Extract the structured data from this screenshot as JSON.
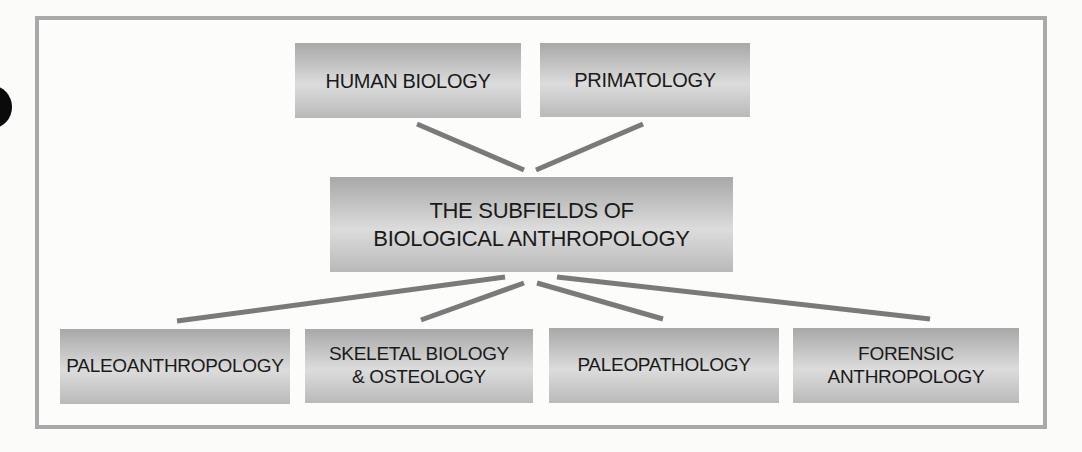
{
  "diagram": {
    "type": "hierarchy",
    "central": {
      "lines": [
        "THE SUBFIELDS OF",
        "BIOLOGICAL ANTHROPOLOGY"
      ]
    },
    "upper_nodes": [
      {
        "lines": [
          "HUMAN BIOLOGY"
        ]
      },
      {
        "lines": [
          "PRIMATOLOGY"
        ]
      }
    ],
    "lower_nodes": [
      {
        "lines": [
          "PALEOANTHROPOLOGY"
        ]
      },
      {
        "lines": [
          "SKELETAL BIOLOGY",
          "& OSTEOLOGY"
        ]
      },
      {
        "lines": [
          "PALEOPATHOLOGY"
        ]
      },
      {
        "lines": [
          "FORENSIC",
          "ANTHROPOLOGY"
        ]
      }
    ],
    "colors": {
      "frame_border": "#a9a9a9",
      "connector": "#7a7a7a",
      "node_fill_dark": "#a8a8a8",
      "node_fill_light": "#dcdcdc",
      "text": "#1a1a1a",
      "background": "#fbfbfa"
    }
  }
}
